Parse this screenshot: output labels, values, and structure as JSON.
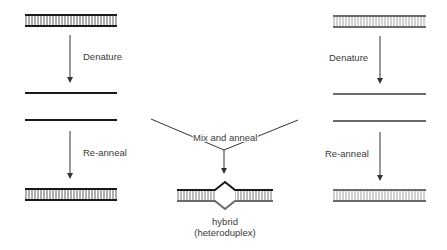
{
  "colors": {
    "strand_a": "#1a1a1a",
    "strand_b": "#6b6b6b",
    "rung_a": "#333333",
    "rung_b": "#8a8a8a",
    "text": "#3a3a3a",
    "arrow": "#333333",
    "background": "#ffffff"
  },
  "left_column": {
    "step1_label": "Denature",
    "step2_label": "Re-anneal"
  },
  "right_column": {
    "step1_label": "Denature",
    "step2_label": "Re-anneal"
  },
  "center": {
    "mix_label": "Mix and anneal",
    "result_label_line1": "hybrid",
    "result_label_line2": "(heteroduplex)"
  }
}
